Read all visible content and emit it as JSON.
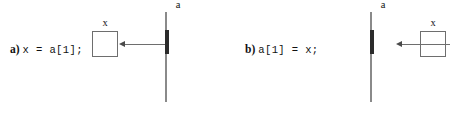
{
  "figure": {
    "title": "",
    "background_color": "#ffffff",
    "line_color": "#6e6e6e",
    "highlight_color": "#2b2b2b",
    "panels": [
      {
        "id": "panel-a",
        "marker": "a)",
        "code": "x = a[1];",
        "variable": {
          "name": "x",
          "label": "x",
          "value": ""
        },
        "array": {
          "name": "a",
          "label": "a",
          "cell_count": 4,
          "highlighted_index": 1,
          "cells": [
            "",
            "",
            "",
            ""
          ]
        },
        "arrow": {
          "direction": "right-to-left",
          "from": "array-cell-1",
          "to": "variable-x",
          "head": "left"
        }
      },
      {
        "id": "panel-b",
        "marker": "b)",
        "code": "a[1] = x;",
        "variable": {
          "name": "x",
          "label": "x",
          "value": ""
        },
        "array": {
          "name": "a",
          "label": "a",
          "cell_count": 4,
          "highlighted_index": 1,
          "cells": [
            "",
            "",
            "",
            ""
          ]
        },
        "arrow": {
          "direction": "right-to-left",
          "from": "variable-x",
          "to": "array-cell-1",
          "head": "left"
        }
      }
    ]
  }
}
